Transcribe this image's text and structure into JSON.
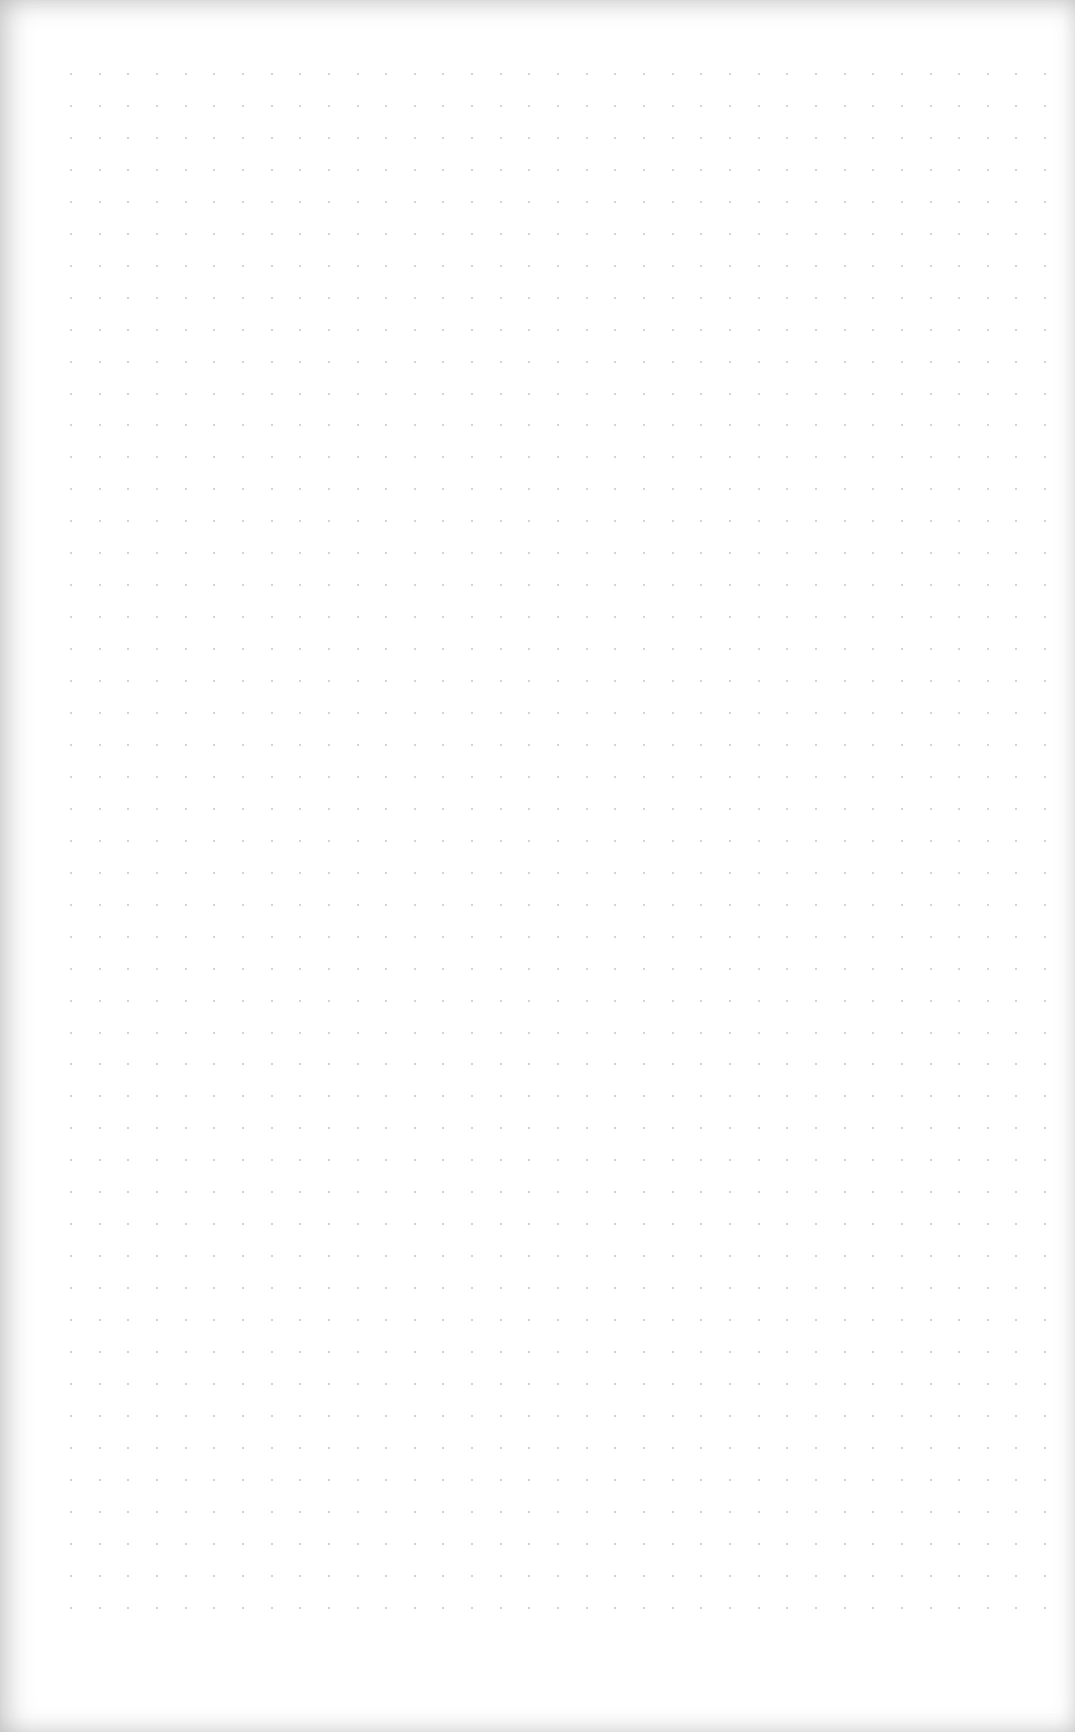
{
  "page": {
    "type": "dot-grid notebook page",
    "content": "",
    "background_color": "#ffffff",
    "dot_color": "#c4c4c4"
  },
  "dot_grid": {
    "origin_x": 71,
    "origin_y": 74,
    "spacing_x": 28.65,
    "spacing_y": 31.95,
    "columns": 35,
    "rows": 49
  }
}
